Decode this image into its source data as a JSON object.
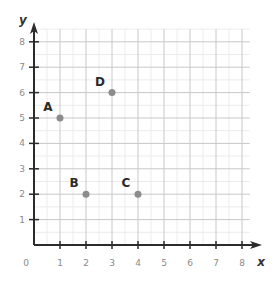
{
  "chart_data": {
    "type": "scatter",
    "title": "",
    "xlabel": "x",
    "ylabel": "y",
    "xlim": [
      0,
      8
    ],
    "ylim": [
      0,
      8
    ],
    "grid": true,
    "x_ticks": [
      "1",
      "2",
      "3",
      "4",
      "5",
      "6",
      "7",
      "8"
    ],
    "y_ticks": [
      "1",
      "2",
      "3",
      "4",
      "5",
      "6",
      "7",
      "8"
    ],
    "origin_label": "0",
    "points": [
      {
        "label": "A",
        "x": 1,
        "y": 5
      },
      {
        "label": "B",
        "x": 2,
        "y": 2
      },
      {
        "label": "C",
        "x": 4,
        "y": 2
      },
      {
        "label": "D",
        "x": 3,
        "y": 6
      }
    ],
    "colors": {
      "point": "#8c8c8c",
      "axis": "#2b2b2b",
      "grid_major": "#c8c8c8",
      "grid_minor": "#ececec"
    }
  }
}
